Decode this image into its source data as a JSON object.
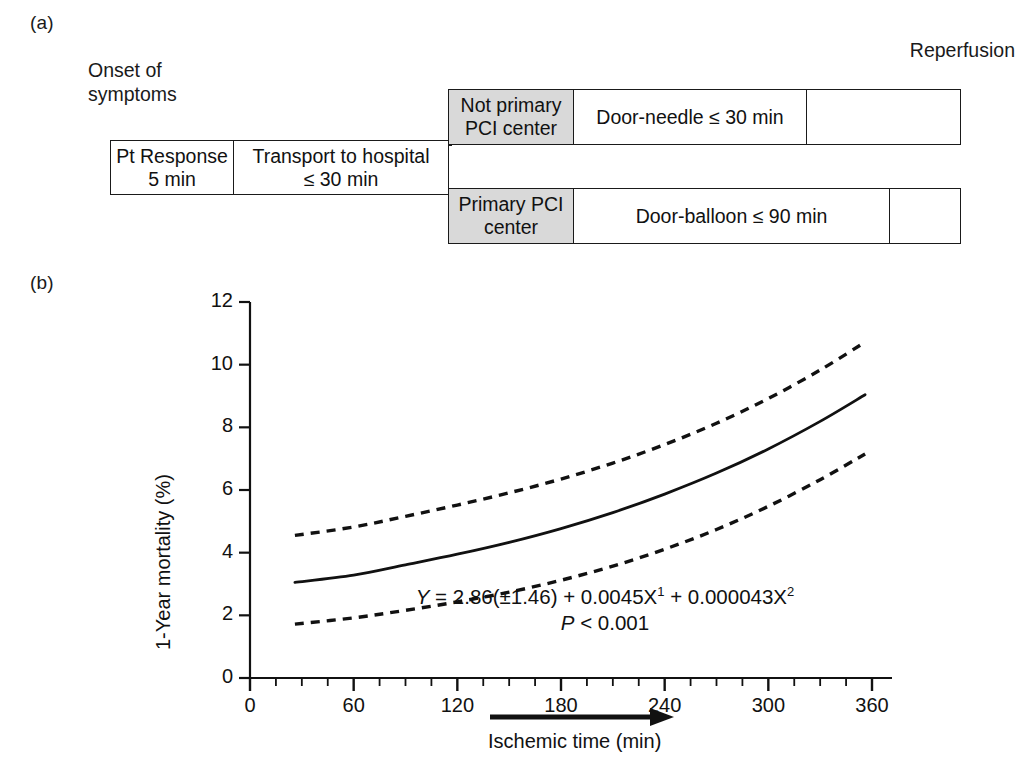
{
  "figure": {
    "panel_a_label": "(a)",
    "panel_b_label": "(b)"
  },
  "flow": {
    "onset_label": "Onset of\nsymptoms",
    "reperfusion_label": "Reperfusion",
    "boxes": {
      "pt_response": "Pt Response\n5 min",
      "transport": "Transport to hospital\n≤ 30 min",
      "not_primary_pci": "Not primary\nPCI center",
      "door_needle": "Door-needle ≤ 30 min",
      "primary_pci": "Primary PCI\ncenter",
      "door_balloon": "Door-balloon ≤ 90 min",
      "tail_top": "",
      "tail_bottom": ""
    },
    "shaded_color": "#d9d9d9",
    "border_color": "#1a1a1a"
  },
  "chart_data": {
    "type": "line",
    "title": "",
    "xlabel": "Ischemic time (min)",
    "ylabel": "1-Year mortality (%)",
    "xlim": [
      0,
      375
    ],
    "ylim": [
      0,
      12
    ],
    "xticks": [
      0,
      60,
      120,
      180,
      240,
      300,
      360
    ],
    "xtick_labels": [
      "0",
      "60",
      "120",
      "180",
      "240",
      "300",
      "360"
    ],
    "x_minor_tick_step": 15,
    "yticks": [
      0,
      2,
      4,
      6,
      8,
      10,
      12
    ],
    "ytick_labels": [
      "0",
      "2",
      "4",
      "6",
      "8",
      "10",
      "12"
    ],
    "grid": false,
    "legend": "none",
    "x": [
      26,
      60,
      90,
      120,
      150,
      180,
      210,
      240,
      270,
      300,
      330,
      356
    ],
    "series": [
      {
        "name": "Predicted 1-year mortality",
        "style": "solid",
        "values": [
          3.05,
          3.28,
          3.61,
          3.95,
          4.33,
          4.77,
          5.28,
          5.87,
          6.54,
          7.31,
          8.19,
          9.04
        ]
      },
      {
        "name": "Upper 95% confidence limit",
        "style": "dashed",
        "values": [
          4.55,
          4.82,
          5.16,
          5.52,
          5.91,
          6.35,
          6.86,
          7.45,
          8.13,
          8.92,
          9.83,
          10.72
        ]
      },
      {
        "name": "Lower 95% confidence limit",
        "style": "dashed",
        "values": [
          1.72,
          1.92,
          2.16,
          2.43,
          2.74,
          3.12,
          3.57,
          4.11,
          4.74,
          5.48,
          6.33,
          7.15
        ]
      }
    ],
    "annotations": {
      "equation_line1_parts": {
        "y_symbol": "Y",
        "rest": " = 2.86(±1.46) + 0.0045X",
        "exp1": "1",
        "rest2": " + 0.000043X",
        "exp2": "2"
      },
      "equation_line2_parts": {
        "p_symbol": "P",
        "rest": " <  0.001"
      },
      "arrow_label": "Ischemic time (min)"
    }
  }
}
